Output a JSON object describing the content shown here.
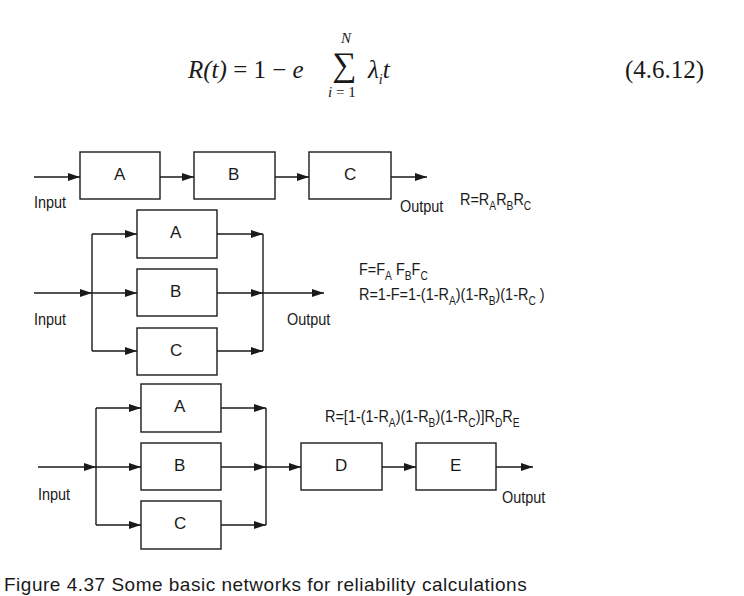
{
  "equation": {
    "lhs": "R(t)",
    "equals": "=",
    "one": "1",
    "minus": "−",
    "e": "e",
    "sum_symbol": "∑",
    "sum_upper": "N",
    "sum_lower_var": "i",
    "sum_lower_rest": " = 1",
    "term_lambda": "λ",
    "term_sub": "i",
    "term_t": "t",
    "number": "(4.6.12)"
  },
  "series_network": {
    "input_label": "Input",
    "output_label": "Output",
    "blocks": [
      "A",
      "B",
      "C"
    ],
    "formula": {
      "prefix": "R=R",
      "parts": [
        {
          "sub": "A",
          "after": "R"
        },
        {
          "sub": "B",
          "after": "R"
        },
        {
          "sub": "C",
          "after": ""
        }
      ]
    }
  },
  "parallel_network": {
    "input_label": "Input",
    "output_label": "Output",
    "blocks": [
      "A",
      "B",
      "C"
    ],
    "formula_f": {
      "prefix": "F=F",
      "parts": [
        {
          "sub": "A",
          "after": " F"
        },
        {
          "sub": "B",
          "after": "F"
        },
        {
          "sub": "C",
          "after": ""
        }
      ]
    },
    "formula_r": {
      "prefix": "R=1-F=1-(1-R",
      "parts": [
        {
          "sub": "A",
          "after": ")(1-R"
        },
        {
          "sub": "B",
          "after": ")(1-R"
        },
        {
          "sub": "C",
          "after": " )"
        }
      ]
    }
  },
  "mixed_network": {
    "input_label": "Input",
    "output_label": "Output",
    "parallel_blocks": [
      "A",
      "B",
      "C"
    ],
    "series_blocks": [
      "D",
      "E"
    ],
    "formula": {
      "prefix": "R=[1-(1-R",
      "parts": [
        {
          "sub": "A",
          "after": ")(1-R"
        },
        {
          "sub": "B",
          "after": ")(1-R"
        },
        {
          "sub": "C",
          "after": ")]R"
        },
        {
          "sub": "D",
          "after": "R"
        },
        {
          "sub": "E",
          "after": ""
        }
      ]
    }
  },
  "caption": "Figure 4.37  Some basic networks for reliability calculations"
}
